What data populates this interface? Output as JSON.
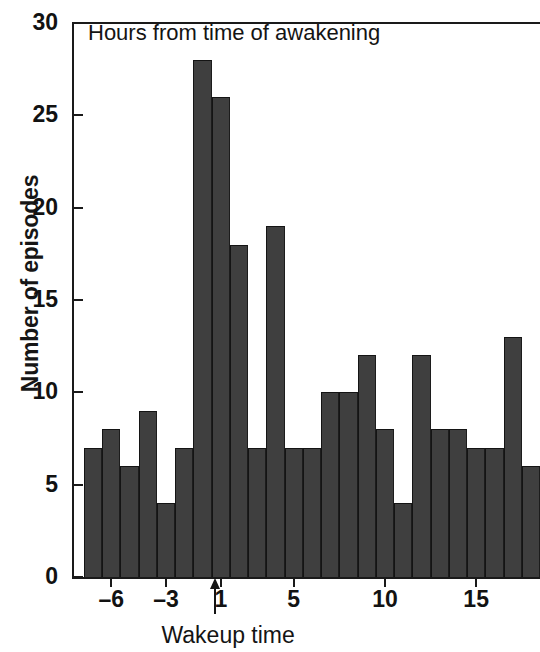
{
  "chart_data": {
    "type": "bar",
    "title": "Hours from time of awakening",
    "xlabel": "Wakeup time",
    "ylabel": "Number of episodes",
    "categories": [
      -7,
      -6,
      -5,
      -4,
      -3,
      -2,
      -1,
      1,
      2,
      3,
      4,
      5,
      6,
      7,
      8,
      9,
      10,
      11,
      12,
      13,
      14,
      15,
      16,
      17,
      18
    ],
    "values": [
      7,
      8,
      6,
      9,
      4,
      7,
      28,
      26,
      18,
      7,
      19,
      7,
      7,
      10,
      10,
      12,
      8,
      4,
      12,
      8,
      8,
      7,
      7,
      13,
      6
    ],
    "ylim": [
      0,
      30
    ],
    "xlim": [
      -7,
      19
    ],
    "yticks": [
      0,
      5,
      10,
      15,
      20,
      25,
      30
    ],
    "ytick_labels": [
      "0",
      "5",
      "10",
      "15",
      "20",
      "25",
      "30"
    ],
    "xticks": [
      -6,
      -3,
      1,
      5,
      10,
      15
    ],
    "xtick_labels": [
      "–6",
      "–3",
      "1",
      "5",
      "10",
      "15"
    ],
    "grid": false,
    "legend": null,
    "annotations": [
      {
        "name": "wakeup-time-arrow",
        "label": "Wakeup time",
        "x": 1
      }
    ],
    "bar_color": "#3f3f3f",
    "axis_color": "#1a1a1a"
  },
  "axis": {
    "y_title": "Number of episodes",
    "x_annotation": "Wakeup time"
  },
  "plot": {
    "title": "Hours from time of awakening"
  }
}
